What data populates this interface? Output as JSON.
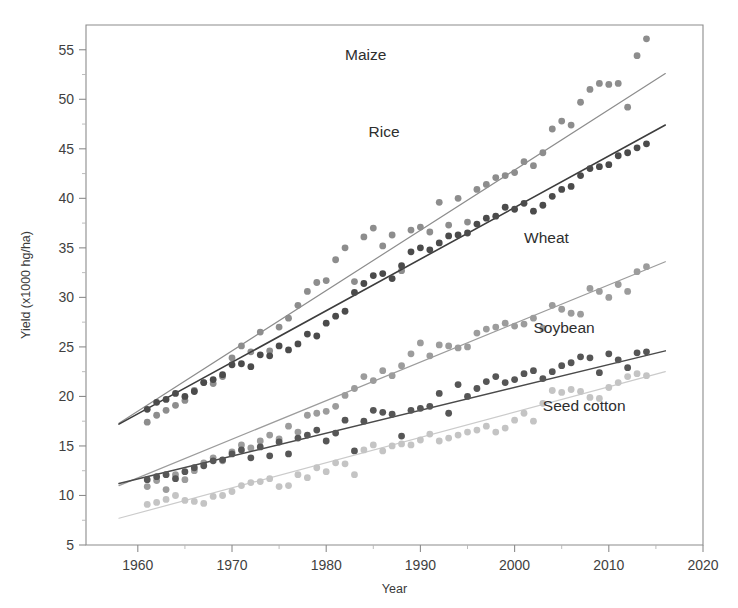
{
  "chart_data": {
    "type": "scatter",
    "title": "",
    "xlabel": "Year",
    "ylabel": "Yield (x1000 hg/ha)",
    "xlim": [
      1954.5,
      2020
    ],
    "ylim": [
      5,
      57.5
    ],
    "xticks": [
      1960,
      1970,
      1980,
      1990,
      2000,
      2010,
      2020
    ],
    "xtick_labels": [
      "1960",
      "1970",
      "1980",
      "1990",
      "2000",
      "2010",
      "2020"
    ],
    "yticks": [
      5,
      10,
      15,
      20,
      25,
      30,
      35,
      40,
      45,
      50,
      55
    ],
    "ytick_labels": [
      "5",
      "10",
      "15",
      "20",
      "25",
      "30",
      "35",
      "40",
      "45",
      "50",
      "55"
    ],
    "yticks_minor": [
      7.5,
      12.5,
      17.5,
      22.5,
      27.5,
      32.5,
      37.5,
      42.5,
      47.5,
      52.5
    ],
    "grid": false,
    "legend_position": "inline-right-of-series",
    "marker_radius_px": 3.4,
    "series": [
      {
        "name": "Maize",
        "color": "#8d8d8d",
        "line_color": "#8d8d8d",
        "line_width": 1.2,
        "label_x": 1982.0,
        "label_y": 54.0,
        "trend": {
          "x0": 1958.0,
          "y0": 17.3,
          "x1": 2016.0,
          "y1": 52.6
        },
        "points": [
          [
            1961,
            17.4
          ],
          [
            1962,
            18.1
          ],
          [
            1963,
            18.6
          ],
          [
            1964,
            19.1
          ],
          [
            1965,
            19.6
          ],
          [
            1966,
            20.6
          ],
          [
            1967,
            21.4
          ],
          [
            1968,
            21.3
          ],
          [
            1969,
            22.0
          ],
          [
            1970,
            23.9
          ],
          [
            1971,
            25.1
          ],
          [
            1972,
            24.5
          ],
          [
            1973,
            26.5
          ],
          [
            1974,
            24.6
          ],
          [
            1975,
            27.0
          ],
          [
            1976,
            27.9
          ],
          [
            1977,
            29.2
          ],
          [
            1978,
            30.6
          ],
          [
            1979,
            31.5
          ],
          [
            1980,
            31.7
          ],
          [
            1981,
            33.8
          ],
          [
            1982,
            35.0
          ],
          [
            1983,
            31.6
          ],
          [
            1984,
            36.1
          ],
          [
            1985,
            37.0
          ],
          [
            1986,
            35.2
          ],
          [
            1987,
            36.3
          ],
          [
            1988,
            32.7
          ],
          [
            1989,
            36.8
          ],
          [
            1990,
            37.1
          ],
          [
            1991,
            36.6
          ],
          [
            1992,
            39.6
          ],
          [
            1993,
            37.3
          ],
          [
            1994,
            40.0
          ],
          [
            1995,
            37.6
          ],
          [
            1996,
            40.9
          ],
          [
            1997,
            41.4
          ],
          [
            1998,
            42.1
          ],
          [
            1999,
            42.3
          ],
          [
            2000,
            42.6
          ],
          [
            2001,
            43.7
          ],
          [
            2002,
            43.3
          ],
          [
            2003,
            44.6
          ],
          [
            2004,
            47.0
          ],
          [
            2005,
            47.8
          ],
          [
            2006,
            47.4
          ],
          [
            2007,
            49.7
          ],
          [
            2008,
            51.0
          ],
          [
            2009,
            51.6
          ],
          [
            2010,
            51.5
          ],
          [
            2011,
            51.6
          ],
          [
            2012,
            49.2
          ],
          [
            2013,
            54.4
          ],
          [
            2014,
            56.1
          ]
        ]
      },
      {
        "name": "Rice",
        "color": "#4b4b4b",
        "line_color": "#3d3d3d",
        "line_width": 1.6,
        "label_x": 1984.5,
        "label_y": 46.2,
        "trend": {
          "x0": 1958.0,
          "y0": 17.2,
          "x1": 2016.0,
          "y1": 47.4
        },
        "points": [
          [
            1961,
            18.7
          ],
          [
            1962,
            19.4
          ],
          [
            1963,
            19.7
          ],
          [
            1964,
            20.3
          ],
          [
            1965,
            20.0
          ],
          [
            1966,
            20.5
          ],
          [
            1967,
            21.4
          ],
          [
            1968,
            21.7
          ],
          [
            1969,
            22.2
          ],
          [
            1970,
            23.2
          ],
          [
            1971,
            23.3
          ],
          [
            1972,
            23.0
          ],
          [
            1973,
            24.2
          ],
          [
            1974,
            24.1
          ],
          [
            1975,
            25.1
          ],
          [
            1976,
            24.7
          ],
          [
            1977,
            25.3
          ],
          [
            1978,
            26.3
          ],
          [
            1979,
            26.1
          ],
          [
            1980,
            27.4
          ],
          [
            1981,
            28.1
          ],
          [
            1982,
            28.6
          ],
          [
            1983,
            30.5
          ],
          [
            1984,
            31.4
          ],
          [
            1985,
            32.2
          ],
          [
            1986,
            32.4
          ],
          [
            1987,
            31.9
          ],
          [
            1988,
            33.2
          ],
          [
            1989,
            34.6
          ],
          [
            1990,
            35.0
          ],
          [
            1991,
            34.8
          ],
          [
            1992,
            35.5
          ],
          [
            1993,
            36.2
          ],
          [
            1994,
            36.3
          ],
          [
            1995,
            36.5
          ],
          [
            1996,
            37.4
          ],
          [
            1997,
            38.0
          ],
          [
            1998,
            38.2
          ],
          [
            1999,
            39.1
          ],
          [
            2000,
            38.9
          ],
          [
            2001,
            39.5
          ],
          [
            2002,
            38.7
          ],
          [
            2003,
            39.3
          ],
          [
            2004,
            40.2
          ],
          [
            2005,
            40.9
          ],
          [
            2006,
            41.2
          ],
          [
            2007,
            42.3
          ],
          [
            2008,
            43.0
          ],
          [
            2009,
            43.2
          ],
          [
            2010,
            43.4
          ],
          [
            2011,
            44.3
          ],
          [
            2012,
            44.6
          ],
          [
            2013,
            45.1
          ],
          [
            2014,
            45.5
          ]
        ]
      },
      {
        "name": "Wheat",
        "color": "#9c9c9c",
        "line_color": "#9c9c9c",
        "line_width": 1.2,
        "label_x": 2001.0,
        "label_y": 35.5,
        "trend": {
          "x0": 1958.0,
          "y0": 11.0,
          "x1": 2016.0,
          "y1": 33.6
        },
        "points": [
          [
            1961,
            10.9
          ],
          [
            1962,
            11.5
          ],
          [
            1963,
            10.6
          ],
          [
            1964,
            12.1
          ],
          [
            1965,
            11.6
          ],
          [
            1966,
            12.5
          ],
          [
            1967,
            13.3
          ],
          [
            1968,
            13.8
          ],
          [
            1969,
            13.5
          ],
          [
            1970,
            14.4
          ],
          [
            1971,
            15.1
          ],
          [
            1972,
            14.8
          ],
          [
            1973,
            15.5
          ],
          [
            1974,
            16.1
          ],
          [
            1975,
            15.7
          ],
          [
            1976,
            17.0
          ],
          [
            1977,
            16.4
          ],
          [
            1978,
            18.1
          ],
          [
            1979,
            18.3
          ],
          [
            1980,
            18.5
          ],
          [
            1981,
            19.0
          ],
          [
            1982,
            20.1
          ],
          [
            1983,
            20.8
          ],
          [
            1984,
            22.0
          ],
          [
            1985,
            21.6
          ],
          [
            1986,
            22.6
          ],
          [
            1987,
            22.1
          ],
          [
            1988,
            23.1
          ],
          [
            1989,
            24.3
          ],
          [
            1990,
            25.4
          ],
          [
            1991,
            24.1
          ],
          [
            1992,
            25.2
          ],
          [
            1993,
            25.1
          ],
          [
            1994,
            24.9
          ],
          [
            1995,
            25.0
          ],
          [
            1996,
            26.4
          ],
          [
            1997,
            26.8
          ],
          [
            1998,
            27.0
          ],
          [
            1999,
            27.4
          ],
          [
            2000,
            27.1
          ],
          [
            2001,
            27.3
          ],
          [
            2002,
            27.9
          ],
          [
            2003,
            26.9
          ],
          [
            2004,
            29.2
          ],
          [
            2005,
            28.8
          ],
          [
            2006,
            28.4
          ],
          [
            2007,
            28.3
          ],
          [
            2008,
            30.9
          ],
          [
            2009,
            30.6
          ],
          [
            2010,
            30.0
          ],
          [
            2011,
            31.3
          ],
          [
            2012,
            30.6
          ],
          [
            2013,
            32.6
          ],
          [
            2014,
            33.1
          ]
        ]
      },
      {
        "name": "Soybean",
        "color": "#565656",
        "line_color": "#4a4a4a",
        "line_width": 1.5,
        "label_x": 2002.0,
        "label_y": 26.4,
        "trend": {
          "x0": 1958.0,
          "y0": 11.2,
          "x1": 2016.0,
          "y1": 24.6
        },
        "points": [
          [
            1961,
            11.6
          ],
          [
            1962,
            11.9
          ],
          [
            1963,
            12.1
          ],
          [
            1964,
            11.7
          ],
          [
            1965,
            12.4
          ],
          [
            1966,
            12.8
          ],
          [
            1967,
            13.0
          ],
          [
            1968,
            13.5
          ],
          [
            1969,
            13.6
          ],
          [
            1970,
            14.2
          ],
          [
            1971,
            14.6
          ],
          [
            1972,
            13.8
          ],
          [
            1973,
            14.9
          ],
          [
            1974,
            14.0
          ],
          [
            1975,
            15.4
          ],
          [
            1976,
            14.2
          ],
          [
            1977,
            15.8
          ],
          [
            1978,
            16.1
          ],
          [
            1979,
            16.6
          ],
          [
            1980,
            15.5
          ],
          [
            1981,
            16.3
          ],
          [
            1982,
            17.6
          ],
          [
            1983,
            14.5
          ],
          [
            1984,
            17.5
          ],
          [
            1985,
            18.6
          ],
          [
            1986,
            18.4
          ],
          [
            1987,
            18.2
          ],
          [
            1988,
            16.0
          ],
          [
            1989,
            18.6
          ],
          [
            1990,
            18.8
          ],
          [
            1991,
            19.0
          ],
          [
            1992,
            20.3
          ],
          [
            1993,
            18.3
          ],
          [
            1994,
            21.2
          ],
          [
            1995,
            20.0
          ],
          [
            1996,
            20.8
          ],
          [
            1997,
            21.5
          ],
          [
            1998,
            22.0
          ],
          [
            1999,
            21.4
          ],
          [
            2000,
            21.7
          ],
          [
            2001,
            22.3
          ],
          [
            2002,
            22.6
          ],
          [
            2003,
            21.8
          ],
          [
            2004,
            22.5
          ],
          [
            2005,
            23.1
          ],
          [
            2006,
            23.4
          ],
          [
            2007,
            24.0
          ],
          [
            2008,
            23.9
          ],
          [
            2009,
            22.4
          ],
          [
            2010,
            24.3
          ],
          [
            2011,
            23.7
          ],
          [
            2012,
            22.9
          ],
          [
            2013,
            24.4
          ],
          [
            2014,
            24.5
          ]
        ]
      },
      {
        "name": "Seed cotton",
        "color": "#c4c4c4",
        "line_color": "#cbcbcb",
        "line_width": 1.2,
        "label_x": 2003.0,
        "label_y": 18.5,
        "trend": {
          "x0": 1958.0,
          "y0": 7.7,
          "x1": 2016.0,
          "y1": 22.5
        },
        "points": [
          [
            1961,
            9.1
          ],
          [
            1962,
            9.3
          ],
          [
            1963,
            9.6
          ],
          [
            1964,
            10.0
          ],
          [
            1965,
            9.5
          ],
          [
            1966,
            9.4
          ],
          [
            1967,
            9.2
          ],
          [
            1968,
            9.9
          ],
          [
            1969,
            10.0
          ],
          [
            1970,
            10.4
          ],
          [
            1971,
            11.0
          ],
          [
            1972,
            11.3
          ],
          [
            1973,
            11.4
          ],
          [
            1974,
            11.7
          ],
          [
            1975,
            10.9
          ],
          [
            1976,
            11.0
          ],
          [
            1977,
            12.1
          ],
          [
            1978,
            11.8
          ],
          [
            1979,
            12.8
          ],
          [
            1980,
            12.4
          ],
          [
            1981,
            13.3
          ],
          [
            1982,
            13.2
          ],
          [
            1983,
            12.1
          ],
          [
            1984,
            14.6
          ],
          [
            1985,
            15.1
          ],
          [
            1986,
            14.5
          ],
          [
            1987,
            15.0
          ],
          [
            1988,
            15.2
          ],
          [
            1989,
            15.1
          ],
          [
            1990,
            15.6
          ],
          [
            1991,
            16.2
          ],
          [
            1992,
            15.5
          ],
          [
            1993,
            15.8
          ],
          [
            1994,
            16.1
          ],
          [
            1995,
            16.4
          ],
          [
            1996,
            16.6
          ],
          [
            1997,
            17.0
          ],
          [
            1998,
            16.4
          ],
          [
            1999,
            16.8
          ],
          [
            2000,
            17.6
          ],
          [
            2001,
            18.3
          ],
          [
            2002,
            17.5
          ],
          [
            2003,
            19.3
          ],
          [
            2004,
            20.6
          ],
          [
            2005,
            20.4
          ],
          [
            2006,
            20.7
          ],
          [
            2007,
            20.5
          ],
          [
            2008,
            19.9
          ],
          [
            2009,
            19.8
          ],
          [
            2010,
            20.9
          ],
          [
            2011,
            21.4
          ],
          [
            2012,
            22.0
          ],
          [
            2013,
            22.3
          ],
          [
            2014,
            22.1
          ]
        ]
      }
    ]
  }
}
